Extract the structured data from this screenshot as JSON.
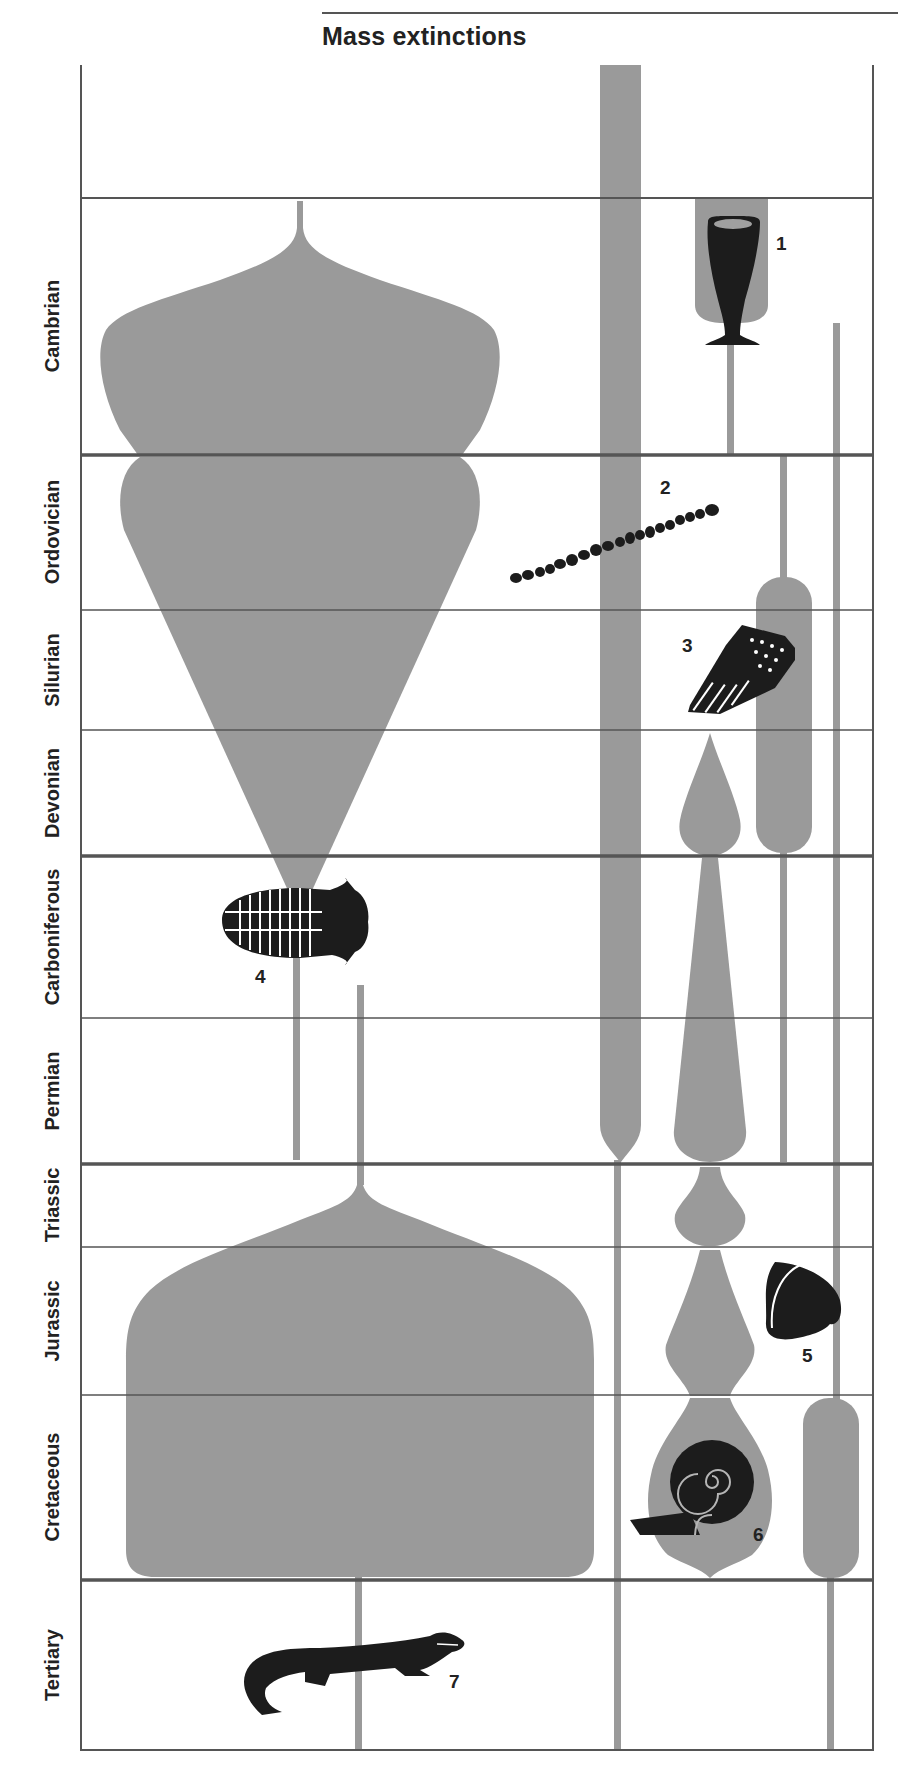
{
  "title": "Mass extinctions",
  "colors": {
    "lineage_fill": "#9a9a9a",
    "fossil_fill": "#1c1c1c",
    "grid_line": "#555555",
    "background": "#ffffff"
  },
  "periods": [
    {
      "name": "Cambrian"
    },
    {
      "name": "Ordovician"
    },
    {
      "name": "Silurian"
    },
    {
      "name": "Devonian"
    },
    {
      "name": "Carboniferous"
    },
    {
      "name": "Permian"
    },
    {
      "name": "Triassic"
    },
    {
      "name": "Jurassic"
    },
    {
      "name": "Cretaceous"
    },
    {
      "name": "Tertiary"
    }
  ],
  "mass_extinction_boundaries": [
    "Cambrian/Ordovician",
    "Devonian/Carboniferous",
    "Permian/Triassic",
    "Triassic/Jurassic",
    "Cretaceous/Tertiary"
  ],
  "fossils": [
    {
      "number": "1",
      "name": "archaeocyathid cup"
    },
    {
      "number": "2",
      "name": "graptolite"
    },
    {
      "number": "3",
      "name": "tabulate coral"
    },
    {
      "number": "4",
      "name": "trilobite"
    },
    {
      "number": "5",
      "name": "bivalve shell"
    },
    {
      "number": "6",
      "name": "ammonite"
    },
    {
      "number": "7",
      "name": "crocodile"
    }
  ]
}
